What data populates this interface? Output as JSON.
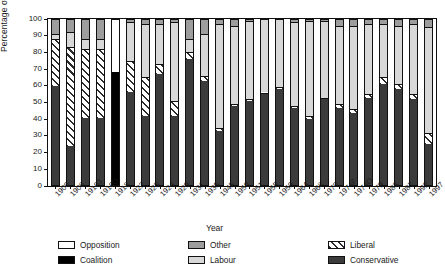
{
  "chart_data": {
    "type": "bar",
    "subtype": "stacked-percentage",
    "title": "",
    "xlabel": "Year",
    "ylabel": "Percentage of seats",
    "ylim": [
      0,
      100
    ],
    "yticks": [
      0,
      10,
      20,
      30,
      40,
      50,
      60,
      70,
      80,
      90,
      100
    ],
    "grid": false,
    "legend_position": "below",
    "legend": [
      "Opposition",
      "Coalition",
      "Other",
      "Labour",
      "Liberal",
      "Conservative"
    ],
    "colors": {
      "Opposition": "#ffffff",
      "Coalition": "#000000",
      "Other": "#9d9d9d",
      "Labour": "#d8d8d8",
      "Liberal": "#ffffff",
      "Conservative": "#3b3b3b"
    },
    "categories": [
      "1900",
      "1906",
      "1910J",
      "1910D",
      "1918",
      "1922",
      "1923",
      "1924",
      "1929",
      "1931",
      "1935",
      "1945",
      "1950",
      "1951",
      "1955",
      "1959",
      "1964",
      "1966",
      "1970",
      "1974F",
      "1974O",
      "1979",
      "1983",
      "1987",
      "1992",
      "1997"
    ],
    "series": [
      {
        "name": "Conservative",
        "values": [
          60,
          24,
          41,
          41,
          0,
          56,
          42,
          67,
          42,
          76,
          63,
          33,
          48,
          51,
          55,
          58,
          47,
          40,
          52,
          47,
          44,
          53,
          61,
          58,
          52,
          25
        ]
      },
      {
        "name": "Coalition",
        "values": [
          0,
          0,
          0,
          0,
          68,
          0,
          0,
          0,
          0,
          0,
          0,
          0,
          0,
          0,
          0,
          0,
          0,
          0,
          0,
          0,
          0,
          0,
          0,
          0,
          0,
          0
        ]
      },
      {
        "name": "Liberal",
        "values": [
          28,
          59,
          41,
          41,
          0,
          19,
          23,
          6,
          9,
          4,
          3,
          2,
          1,
          1,
          1,
          1,
          1,
          2,
          1,
          2,
          2,
          2,
          4,
          3,
          3,
          7
        ]
      },
      {
        "name": "Labour",
        "values": [
          3,
          9,
          6,
          6,
          0,
          23,
          32,
          24,
          47,
          8,
          25,
          62,
          47,
          47,
          44,
          41,
          50,
          57,
          46,
          47,
          50,
          42,
          32,
          35,
          42,
          63
        ]
      },
      {
        "name": "Other",
        "values": [
          9,
          8,
          12,
          12,
          0,
          2,
          3,
          3,
          2,
          12,
          9,
          3,
          4,
          1,
          0,
          0,
          2,
          1,
          1,
          4,
          4,
          3,
          3,
          4,
          3,
          5
        ]
      },
      {
        "name": "Opposition",
        "values": [
          0,
          0,
          0,
          0,
          32,
          0,
          0,
          0,
          0,
          0,
          0,
          0,
          0,
          0,
          0,
          0,
          0,
          0,
          0,
          0,
          0,
          0,
          0,
          0,
          0,
          0
        ]
      }
    ]
  },
  "axis": {
    "y_title": "Percentage of seats",
    "x_title": "Year"
  },
  "legend_items": [
    {
      "label": "Opposition",
      "key": "opposition"
    },
    {
      "label": "Coalition",
      "key": "coalition"
    },
    {
      "label": "Other",
      "key": "other"
    },
    {
      "label": "Labour",
      "key": "labour"
    },
    {
      "label": "Liberal",
      "key": "liberal"
    },
    {
      "label": "Conservative",
      "key": "conservative"
    }
  ]
}
